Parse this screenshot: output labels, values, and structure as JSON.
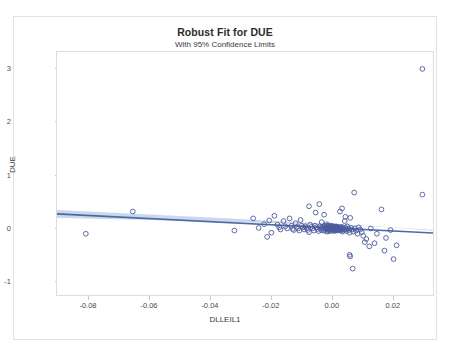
{
  "chart_data": {
    "type": "scatter",
    "title": "Robust Fit for DUE",
    "subtitle": "With 95% Confidence Limits",
    "xlabel": "DLLEIL1",
    "ylabel": "DUE",
    "xlim": [
      -0.0905,
      0.0335
    ],
    "ylim": [
      -1.28,
      3.32
    ],
    "xticks": [
      -0.08,
      -0.06,
      -0.04,
      -0.02,
      0.0,
      0.02
    ],
    "xticklabels": [
      "-0.08",
      "-0.06",
      "-0.04",
      "-0.02",
      "0.00",
      "0.02"
    ],
    "yticks": [
      -1,
      0,
      1,
      2,
      3
    ],
    "yticklabels": [
      "-1",
      "0",
      "1",
      "2",
      "3"
    ],
    "grid": false,
    "legend": null,
    "marker": "open-circle",
    "marker_color": "#4a5a9a",
    "line_color": "#4a6aa5",
    "band_color": "#b9cbe6",
    "fit": {
      "name": "robust-fit-line",
      "x": [
        -0.0905,
        0.0335
      ],
      "y": [
        0.255,
        -0.105
      ],
      "slope": -2.903,
      "intercept": -0.0077
    },
    "confidence_band": {
      "level": 0.95,
      "x": [
        -0.0905,
        -0.075,
        -0.06,
        -0.045,
        -0.03,
        -0.015,
        0.0,
        0.01,
        0.02,
        0.0335
      ],
      "upper": [
        0.33,
        0.288,
        0.245,
        0.202,
        0.158,
        0.113,
        0.068,
        0.037,
        0.003,
        -0.045
      ],
      "lower": [
        0.18,
        0.16,
        0.139,
        0.118,
        0.096,
        0.072,
        0.046,
        0.026,
        0.0,
        -0.062
      ]
    },
    "points": [
      [
        -0.081,
        -0.12
      ],
      [
        -0.0655,
        0.3
      ],
      [
        -0.032,
        -0.06
      ],
      [
        -0.0222,
        0.06
      ],
      [
        -0.0212,
        -0.18
      ],
      [
        -0.0188,
        0.22
      ],
      [
        -0.0178,
        0.05
      ],
      [
        -0.0172,
        0.0
      ],
      [
        -0.0168,
        -0.04
      ],
      [
        -0.0158,
        0.12
      ],
      [
        -0.0152,
        0.02
      ],
      [
        -0.0146,
        -0.02
      ],
      [
        -0.0138,
        0.17
      ],
      [
        -0.0132,
        0.03
      ],
      [
        -0.0128,
        -0.03
      ],
      [
        -0.0124,
        -0.05
      ],
      [
        -0.0118,
        0.08
      ],
      [
        -0.0114,
        0.01
      ],
      [
        -0.011,
        -0.02
      ],
      [
        -0.0106,
        -0.06
      ],
      [
        -0.0102,
        0.14
      ],
      [
        -0.0098,
        0.03
      ],
      [
        -0.0094,
        0.0
      ],
      [
        -0.009,
        -0.04
      ],
      [
        -0.0086,
        0.02
      ],
      [
        -0.0082,
        -0.01
      ],
      [
        -0.0078,
        -0.05
      ],
      [
        -0.0074,
        -0.09
      ],
      [
        -0.007,
        0.05
      ],
      [
        -0.0066,
        0.01
      ],
      [
        -0.0062,
        -0.02
      ],
      [
        -0.0058,
        -0.06
      ],
      [
        -0.0054,
        0.03
      ],
      [
        -0.005,
        0.0
      ],
      [
        -0.0046,
        -0.03
      ],
      [
        -0.0042,
        -0.07
      ],
      [
        -0.004,
        0.44
      ],
      [
        -0.0038,
        0.02
      ],
      [
        -0.0036,
        -0.01
      ],
      [
        -0.0034,
        -0.05
      ],
      [
        -0.0032,
        0.1
      ],
      [
        -0.003,
        0.01
      ],
      [
        -0.0028,
        -0.02
      ],
      [
        -0.0026,
        -0.06
      ],
      [
        -0.0024,
        0.24
      ],
      [
        -0.0022,
        0.03
      ],
      [
        -0.002,
        0.0
      ],
      [
        -0.0019,
        -0.03
      ],
      [
        -0.0018,
        -0.07
      ],
      [
        -0.0017,
        0.06
      ],
      [
        -0.0016,
        0.02
      ],
      [
        -0.0015,
        -0.01
      ],
      [
        -0.0014,
        -0.04
      ],
      [
        -0.0013,
        -0.08
      ],
      [
        -0.0012,
        0.03
      ],
      [
        -0.0011,
        0.0
      ],
      [
        -0.001,
        -0.02
      ],
      [
        -0.0009,
        -0.05
      ],
      [
        -0.0008,
        0.04
      ],
      [
        -0.0007,
        0.01
      ],
      [
        -0.0006,
        -0.01
      ],
      [
        -0.0005,
        -0.04
      ],
      [
        -0.0004,
        -0.07
      ],
      [
        -0.0003,
        0.02
      ],
      [
        -0.0002,
        0.0
      ],
      [
        -0.0001,
        -0.02
      ],
      [
        0.0,
        -0.05
      ],
      [
        0.0001,
        0.03
      ],
      [
        0.0002,
        0.01
      ],
      [
        0.0003,
        -0.01
      ],
      [
        0.0004,
        -0.03
      ],
      [
        0.0005,
        -0.06
      ],
      [
        0.0006,
        0.02
      ],
      [
        0.0007,
        0.0
      ],
      [
        0.0008,
        -0.02
      ],
      [
        0.0009,
        -0.04
      ],
      [
        0.001,
        -0.07
      ],
      [
        0.0011,
        0.01
      ],
      [
        0.0012,
        -0.01
      ],
      [
        0.0013,
        -0.03
      ],
      [
        0.0014,
        -0.05
      ],
      [
        0.0015,
        0.02
      ],
      [
        0.0016,
        0.0
      ],
      [
        0.0017,
        -0.02
      ],
      [
        0.0018,
        -0.04
      ],
      [
        0.0019,
        -0.06
      ],
      [
        0.002,
        0.01
      ],
      [
        0.0021,
        -0.01
      ],
      [
        0.0022,
        -0.03
      ],
      [
        0.0023,
        -0.05
      ],
      [
        0.0024,
        0.0
      ],
      [
        0.0025,
        -0.02
      ],
      [
        0.0026,
        -0.04
      ],
      [
        0.0028,
        0.3
      ],
      [
        0.0029,
        -0.01
      ],
      [
        0.003,
        -0.03
      ],
      [
        0.0031,
        -0.06
      ],
      [
        0.0032,
        0.01
      ],
      [
        0.0033,
        -0.02
      ],
      [
        0.0034,
        -0.04
      ],
      [
        0.0036,
        -0.08
      ],
      [
        0.0038,
        0.0
      ],
      [
        0.004,
        -0.03
      ],
      [
        0.0042,
        -0.05
      ],
      [
        0.0044,
        0.12
      ],
      [
        0.0046,
        -0.01
      ],
      [
        0.0048,
        -0.04
      ],
      [
        0.005,
        -0.07
      ],
      [
        0.0052,
        0.02
      ],
      [
        0.0055,
        -0.02
      ],
      [
        0.0058,
        -0.05
      ],
      [
        0.006,
        -0.1
      ],
      [
        0.0062,
        0.18
      ],
      [
        0.0065,
        -0.01
      ],
      [
        0.0068,
        -0.04
      ],
      [
        0.0072,
        -0.08
      ],
      [
        0.0075,
        0.66
      ],
      [
        0.0078,
        -0.02
      ],
      [
        0.0082,
        -0.06
      ],
      [
        0.0086,
        -0.12
      ],
      [
        0.009,
        0.0
      ],
      [
        0.0095,
        -0.04
      ],
      [
        0.01,
        -0.09
      ],
      [
        0.0105,
        -0.16
      ],
      [
        0.006,
        -0.52
      ],
      [
        0.0062,
        -0.55
      ],
      [
        0.007,
        -0.78
      ],
      [
        0.011,
        -0.28
      ],
      [
        0.0115,
        -0.22
      ],
      [
        0.0125,
        -0.36
      ],
      [
        0.013,
        -0.02
      ],
      [
        0.0142,
        -0.3
      ],
      [
        0.015,
        -0.12
      ],
      [
        0.0165,
        0.34
      ],
      [
        0.0175,
        -0.44
      ],
      [
        0.018,
        -0.2
      ],
      [
        0.0195,
        -0.05
      ],
      [
        0.0205,
        -0.6
      ],
      [
        0.0215,
        -0.34
      ],
      [
        0.03,
        3.0
      ],
      [
        0.03,
        0.62
      ],
      [
        -0.0258,
        0.17
      ],
      [
        -0.024,
        -0.01
      ],
      [
        -0.0205,
        0.13
      ],
      [
        -0.0198,
        -0.1
      ],
      [
        0.0035,
        0.36
      ],
      [
        0.0046,
        0.2
      ],
      [
        -0.0074,
        0.4
      ],
      [
        -0.0052,
        0.28
      ]
    ]
  }
}
